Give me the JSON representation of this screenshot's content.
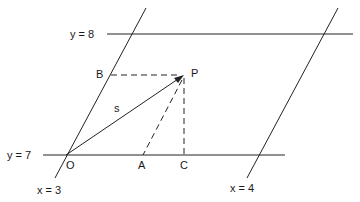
{
  "diagram": {
    "lines": {
      "y8": "y = 8",
      "y7": "y = 7",
      "x3": "x = 3",
      "x4": "x = 4"
    },
    "points": {
      "O": "O",
      "A": "A",
      "C": "C",
      "B": "B",
      "P": "P"
    },
    "segment_label": "s",
    "colors": {
      "line": "#222222",
      "background": "#ffffff"
    }
  }
}
